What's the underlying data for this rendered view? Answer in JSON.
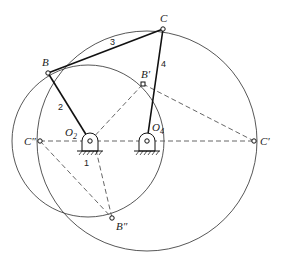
{
  "diagram": {
    "type": "four-bar linkage",
    "points": {
      "B": "B",
      "C": "C",
      "B_prime": "B′",
      "C_prime": "C′",
      "B_dprime": "B″",
      "C_dprime": "C″",
      "O2": "O",
      "O2_sub": "2",
      "O4": "O",
      "O4_sub": "4"
    },
    "links": {
      "l1": "1",
      "l2": "2",
      "l3": "3",
      "l4": "4"
    }
  }
}
